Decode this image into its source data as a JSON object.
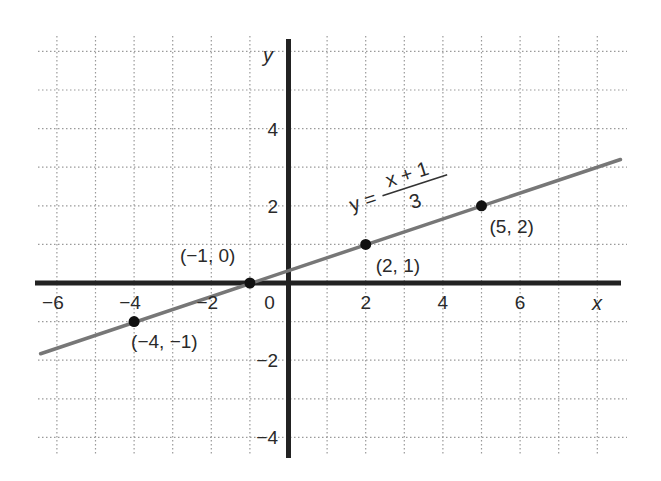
{
  "chart_data": {
    "type": "line",
    "title": "",
    "equation": {
      "lhs": "y =",
      "numerator": "x + 1",
      "denominator": "3"
    },
    "xlabel": "x",
    "ylabel": "y",
    "xlim": [
      -6.5,
      8.5
    ],
    "ylim": [
      -4.5,
      6.5
    ],
    "grid": true,
    "x_ticks": [
      {
        "value": -6,
        "label": "−6"
      },
      {
        "value": -4,
        "label": "−4"
      },
      {
        "value": -2,
        "label": "−2"
      },
      {
        "value": 0,
        "label": "0"
      },
      {
        "value": 2,
        "label": "2"
      },
      {
        "value": 4,
        "label": "4"
      },
      {
        "value": 6,
        "label": "6"
      }
    ],
    "y_ticks": [
      {
        "value": 4,
        "label": "4"
      },
      {
        "value": 2,
        "label": "2"
      },
      {
        "value": -2,
        "label": "−2"
      },
      {
        "value": -4,
        "label": "−4"
      }
    ],
    "series": [
      {
        "name": "y = (x + 1)/3",
        "line": {
          "x1": -6.5,
          "y1": -1.8333,
          "x2": 8.6,
          "y2": 3.2
        },
        "points": [
          {
            "x": -4,
            "y": -1,
            "label": "(−4, −1)"
          },
          {
            "x": -1,
            "y": 0,
            "label": "(−1, 0)"
          },
          {
            "x": 2,
            "y": 1,
            "label": "(2, 1)"
          },
          {
            "x": 5,
            "y": 2,
            "label": "(5, 2)"
          }
        ]
      }
    ],
    "colors": {
      "axis": "#222222",
      "line": "#777777",
      "grid": "#9a9a9a",
      "point": "#111111"
    }
  }
}
